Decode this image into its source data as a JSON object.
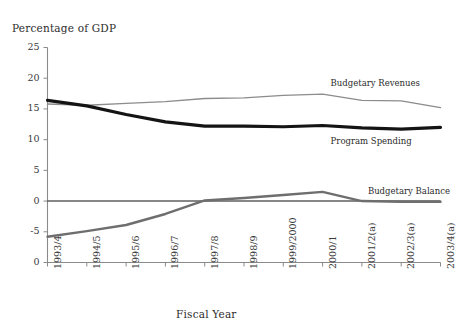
{
  "figure": {
    "yaxis_title": "Percentage of GDP",
    "xaxis_title": "Fiscal Year"
  },
  "chart_data": {
    "type": "line",
    "title": "",
    "ylabel": "Percentage of GDP",
    "xlabel": "Fiscal Year",
    "ylim": [
      -10,
      25
    ],
    "yticks": [
      25,
      20,
      15,
      10,
      5,
      0,
      -5,
      0
    ],
    "ytick_labels": [
      "25",
      "20",
      "15",
      "10",
      "5",
      "0",
      "-5",
      "0"
    ],
    "grid": false,
    "legend_position": "inline-right",
    "categories": [
      "1993/4",
      "1994/5",
      "1995/6",
      "1996/7",
      "1997/8",
      "1998/9",
      "1999/2000",
      "2000/1",
      "2001/2(a)",
      "2002/3(a)",
      "2003/4(a)"
    ],
    "series": [
      {
        "name": "Budgetary Revenues",
        "color": "#8c8c8c",
        "width": 1.3,
        "values": [
          15.8,
          15.6,
          15.9,
          16.2,
          16.7,
          16.8,
          17.2,
          17.4,
          16.4,
          16.3,
          15.2
        ]
      },
      {
        "name": "Program Spending",
        "color": "#141414",
        "width": 3.2,
        "values": [
          16.4,
          15.5,
          14.1,
          12.9,
          12.2,
          12.2,
          12.1,
          12.3,
          11.9,
          11.7,
          12.0
        ]
      },
      {
        "name": "Budgetary Balance",
        "color": "#6e6e6e",
        "width": 2.4,
        "values": [
          -5.8,
          -4.9,
          -3.9,
          -2.1,
          0.1,
          0.5,
          1.0,
          1.5,
          0.0,
          -0.1,
          -0.1
        ]
      }
    ],
    "annotations": [
      {
        "text": "Budgetary Revenues",
        "series": "Budgetary Revenues"
      },
      {
        "text": "Program Spending",
        "series": "Program Spending"
      },
      {
        "text": "Budgetary Balance",
        "series": "Budgetary Balance"
      }
    ],
    "zero_line": {
      "value": 0,
      "color": "#111111"
    }
  }
}
